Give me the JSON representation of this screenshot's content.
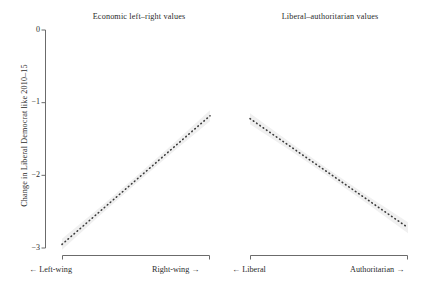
{
  "chart_data": {
    "type": "line",
    "title": "",
    "ylabel": "Change in Liberal Democrat like 2010–15",
    "xlabel": "",
    "ylim": [
      -3.15,
      0.1
    ],
    "yticks": [
      0,
      -1,
      -2,
      -3
    ],
    "ytick_labels": [
      "0",
      "−1",
      "−2",
      "−3"
    ],
    "grid": false,
    "legend": null,
    "panels": [
      {
        "title": "Economic left–right values",
        "axis_low_label": "← Left-wing",
        "axis_high_label": "Right-wing →",
        "line_style": "dotted",
        "band": "95% confidence interval",
        "x": [
          0,
          1
        ],
        "y": [
          -2.95,
          -1.18
        ]
      },
      {
        "title": "Liberal–authoritarian values",
        "axis_low_label": "← Liberal",
        "axis_high_label": "Authoritarian →",
        "line_style": "dotted",
        "band": "95% confidence interval",
        "x": [
          0,
          1
        ],
        "y": [
          -1.22,
          -2.72
        ]
      }
    ]
  },
  "colors": {
    "line": "#3a3a3a",
    "band": "#ededed",
    "axis": "#6b6b6b",
    "text": "#2b2b2b",
    "background": "#ffffff"
  }
}
